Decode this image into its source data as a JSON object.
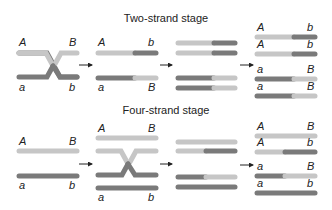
{
  "colors": {
    "light": "#c6c6c6",
    "dark": "#7a7a7a",
    "arrow": "#222222",
    "text": "#222222"
  },
  "two_strand": {
    "title": "Two-strand stage",
    "col1": {
      "top_left": "A",
      "top_right": "B",
      "bottom_left": "a",
      "bottom_right": "b"
    },
    "col2": {
      "top_left": "A",
      "top_right": "b",
      "bottom_left": "a",
      "bottom_right": "B"
    },
    "col4": [
      {
        "left": "A",
        "right": "b"
      },
      {
        "left": "A",
        "right": "b"
      },
      {
        "left": "a",
        "right": "B"
      },
      {
        "left": "a",
        "right": "B"
      }
    ]
  },
  "four_strand": {
    "title": "Four-strand stage",
    "col1": {
      "top_left": "A",
      "top_right": "B",
      "bottom_left": "a",
      "bottom_right": "b"
    },
    "col2": {
      "top_left": "A",
      "top_right": "B",
      "bottom_left": "a",
      "bottom_right": "b"
    },
    "col4": [
      {
        "left": "A",
        "right": "B"
      },
      {
        "left": "A",
        "right": "b"
      },
      {
        "left": "a",
        "right": "B"
      },
      {
        "left": "a",
        "right": "b"
      }
    ]
  }
}
